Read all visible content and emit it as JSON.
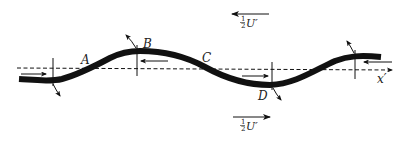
{
  "diagram": {
    "points": {
      "A": "A",
      "B": "B",
      "C": "C",
      "D": "D"
    },
    "axis_label": "x′",
    "top_velocity": {
      "fraction_num": "1",
      "fraction_den": "2",
      "symbol": "U′",
      "direction": "left"
    },
    "bottom_velocity": {
      "fraction_num": "1",
      "fraction_den": "2",
      "symbol": "U′",
      "direction": "right"
    },
    "colors": {
      "stroke": "#111111",
      "background": "#ffffff"
    }
  }
}
